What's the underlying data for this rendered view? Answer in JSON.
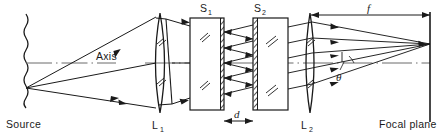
{
  "figure": {
    "type": "optics-ray-diagram",
    "width": 446,
    "height": 134,
    "background_color": "#ffffff",
    "ink_color": "#1a1a1a"
  },
  "labels": {
    "source": "Source",
    "axis": "Axis",
    "lens1": "L",
    "lens1_sub": "1",
    "lens2": "L",
    "lens2_sub": "2",
    "slab1": "S",
    "slab1_sub": "1",
    "slab2": "S",
    "slab2_sub": "2",
    "separation": "d",
    "focal_length": "f",
    "angle": "θ",
    "focal_plane": "Focal plane"
  },
  "components": {
    "source_plane": {
      "name": "Source",
      "kind": "wavy-vertical-line",
      "x": 26,
      "y_top": 14,
      "y_bottom": 104,
      "emission_point_y": 88
    },
    "lens_1": {
      "name": "L1",
      "kind": "biconvex-lens",
      "center_x": 160,
      "center_y": 63,
      "half_height": 50,
      "bulge": 9
    },
    "slab_1": {
      "name": "S1",
      "kind": "plane-parallel-plate",
      "left_x": 190,
      "right_x": 224,
      "top_y": 18,
      "bottom_y": 110,
      "coated_face": "right",
      "coating_style": "hatched-serrated"
    },
    "slab_2": {
      "name": "S2",
      "kind": "plane-parallel-plate",
      "left_x": 253,
      "right_x": 288,
      "top_y": 18,
      "bottom_y": 110,
      "coated_face": "left",
      "coating_style": "hatched-serrated"
    },
    "lens_2": {
      "name": "L2",
      "kind": "biconvex-lens",
      "center_x": 310,
      "center_y": 63,
      "half_height": 50,
      "bulge": 8
    },
    "focal_plane": {
      "name": "Focal plane",
      "kind": "vertical-line",
      "x": 430,
      "y_top": 12,
      "y_bottom": 122,
      "focus_point_y": 44
    },
    "optical_axis": {
      "kind": "dash-dot-line",
      "y": 63,
      "x_start": 26,
      "x_end": 430
    }
  },
  "dimensions": {
    "separation_d": {
      "label": "d",
      "from_x": 224,
      "to_x": 253,
      "y": 121,
      "description": "Gap between the coated faces of S1 and S2"
    },
    "focal_length_f": {
      "label": "f",
      "from_x": 310,
      "to_x": 430,
      "y": 15,
      "description": "Focal length of lens L2 to the focal plane"
    },
    "angle_theta": {
      "label": "θ",
      "vertex_x": 430,
      "vertex_y": 63,
      "description": "Ray inclination angle relative to the optical axis"
    }
  }
}
